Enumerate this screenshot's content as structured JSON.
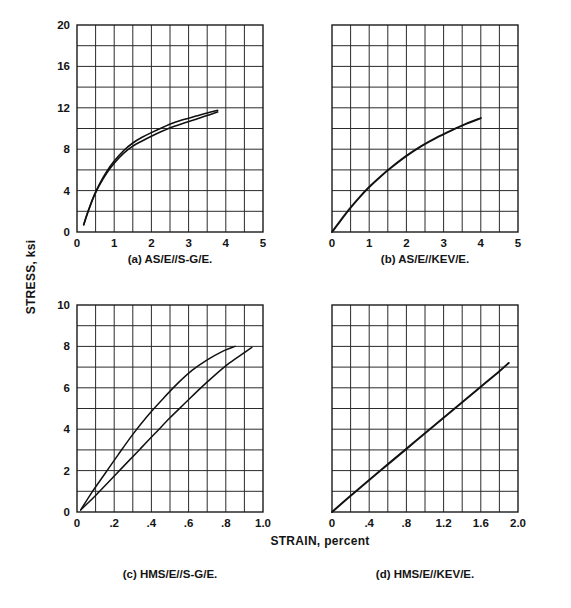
{
  "figure": {
    "axis_titles": {
      "y": "STRESS, ksi",
      "x": "STRAIN, percent"
    },
    "ink_color": "#111111",
    "grid_color": "#2b2b2b",
    "background": "#ffffff"
  },
  "chart_data": [
    {
      "id": "panel-a",
      "type": "line",
      "title": "(a) AS/E//S-G/E.",
      "caption": "(a) AS/E//S-G/E.",
      "xlabel": "STRAIN, percent",
      "ylabel": "STRESS, ksi",
      "xlim": [
        0,
        5
      ],
      "ylim": [
        0,
        20
      ],
      "x_ticks": [
        0,
        1,
        2,
        3,
        4,
        5
      ],
      "x_tick_labels": [
        "0",
        "1",
        "2",
        "3",
        "4",
        "5"
      ],
      "y_ticks": [
        0,
        4,
        8,
        12,
        16,
        20
      ],
      "y_tick_labels": [
        "0",
        "4",
        "8",
        "12",
        "16",
        "20"
      ],
      "grid": true,
      "grid_cols": 10,
      "grid_rows": 10,
      "legend": "none",
      "series": [
        {
          "name": "AS/E//S-G/E stress-strain band (upper)",
          "stroke_width": 1.6,
          "x": [
            0.18,
            0.3,
            0.45,
            0.6,
            0.8,
            1.0,
            1.25,
            1.5,
            1.75,
            2.0,
            2.3,
            2.6,
            2.9,
            3.2,
            3.5,
            3.78
          ],
          "y": [
            0.7,
            2.0,
            3.45,
            4.6,
            5.85,
            6.85,
            7.85,
            8.6,
            9.15,
            9.6,
            10.1,
            10.55,
            10.9,
            11.2,
            11.5,
            11.75
          ]
        },
        {
          "name": "AS/E//S-G/E stress-strain band (lower)",
          "stroke_width": 1.6,
          "x": [
            0.18,
            0.3,
            0.45,
            0.6,
            0.8,
            1.0,
            1.25,
            1.5,
            1.75,
            2.0,
            2.3,
            2.6,
            2.9,
            3.2,
            3.5,
            3.78
          ],
          "y": [
            0.7,
            2.0,
            3.4,
            4.5,
            5.7,
            6.65,
            7.6,
            8.3,
            8.8,
            9.25,
            9.75,
            10.2,
            10.55,
            10.9,
            11.25,
            11.6
          ]
        }
      ]
    },
    {
      "id": "panel-b",
      "type": "line",
      "title": "(b) AS/E//KEV/E.",
      "caption": "(b) AS/E//KEV/E.",
      "xlabel": "STRAIN, percent",
      "ylabel": "STRESS, ksi",
      "xlim": [
        0,
        5
      ],
      "ylim": [
        0,
        20
      ],
      "x_ticks": [
        0,
        1,
        2,
        3,
        4,
        5
      ],
      "x_tick_labels": [
        "0",
        "1",
        "2",
        "3",
        "4",
        "5"
      ],
      "y_ticks": [
        0,
        4,
        8,
        12,
        16,
        20
      ],
      "y_tick_labels": [],
      "grid": true,
      "grid_cols": 10,
      "grid_rows": 10,
      "legend": "none",
      "series": [
        {
          "name": "AS/E//KEV/E stress-strain",
          "stroke_width": 2.0,
          "x": [
            0.0,
            0.25,
            0.5,
            0.75,
            1.0,
            1.3,
            1.6,
            2.0,
            2.4,
            2.8,
            3.2,
            3.6,
            4.0
          ],
          "y": [
            0.0,
            1.2,
            2.35,
            3.4,
            4.35,
            5.35,
            6.25,
            7.35,
            8.3,
            9.1,
            9.8,
            10.45,
            11.0
          ]
        }
      ]
    },
    {
      "id": "panel-c",
      "type": "line",
      "title": "(c) HMS/E//S-G/E.",
      "caption": "(c) HMS/E//S-G/E.",
      "xlabel": "STRAIN, percent",
      "ylabel": "STRESS, ksi",
      "xlim": [
        0,
        1.0
      ],
      "ylim": [
        0,
        10
      ],
      "x_ticks": [
        0,
        0.2,
        0.4,
        0.6,
        0.8,
        1.0
      ],
      "x_tick_labels": [
        "0",
        ".2",
        ".4",
        ".6",
        ".8",
        "1.0"
      ],
      "y_ticks": [
        0,
        2,
        4,
        6,
        8,
        10
      ],
      "y_tick_labels": [
        "0",
        "2",
        "4",
        "6",
        "8",
        "10"
      ],
      "grid": true,
      "grid_cols": 10,
      "grid_rows": 10,
      "legend": "none",
      "series": [
        {
          "name": "HMS/E//S-G/E stress-strain (upper)",
          "stroke_width": 1.5,
          "x": [
            0.02,
            0.08,
            0.15,
            0.22,
            0.3,
            0.38,
            0.46,
            0.54,
            0.62,
            0.7,
            0.78,
            0.85
          ],
          "y": [
            0.1,
            0.95,
            1.85,
            2.75,
            3.75,
            4.65,
            5.45,
            6.2,
            6.85,
            7.35,
            7.75,
            8.0
          ]
        },
        {
          "name": "HMS/E//S-G/E stress-strain (lower)",
          "stroke_width": 1.5,
          "x": [
            0.02,
            0.1,
            0.18,
            0.26,
            0.34,
            0.42,
            0.5,
            0.58,
            0.66,
            0.74,
            0.82,
            0.9,
            0.94
          ],
          "y": [
            0.1,
            0.8,
            1.55,
            2.3,
            3.05,
            3.8,
            4.55,
            5.25,
            5.95,
            6.6,
            7.2,
            7.7,
            7.95
          ]
        }
      ]
    },
    {
      "id": "panel-d",
      "type": "line",
      "title": "(d) HMS/E//KEV/E.",
      "caption": "(d) HMS/E//KEV/E.",
      "xlabel": "STRAIN, percent",
      "ylabel": "STRESS, ksi",
      "xlim": [
        0,
        2.0
      ],
      "ylim": [
        0,
        10
      ],
      "x_ticks": [
        0,
        0.4,
        0.8,
        1.2,
        1.6,
        2.0
      ],
      "x_tick_labels": [
        "0",
        ".4",
        ".8",
        "1.2",
        "1.6",
        "2.0"
      ],
      "y_ticks": [
        0,
        2,
        4,
        6,
        8,
        10
      ],
      "y_tick_labels": [],
      "grid": true,
      "grid_cols": 10,
      "grid_rows": 10,
      "legend": "none",
      "series": [
        {
          "name": "HMS/E//KEV/E stress-strain",
          "stroke_width": 2.0,
          "x": [
            0.0,
            0.2,
            0.4,
            0.6,
            0.8,
            1.0,
            1.2,
            1.4,
            1.6,
            1.8,
            1.9
          ],
          "y": [
            0.0,
            0.78,
            1.55,
            2.3,
            3.05,
            3.8,
            4.55,
            5.3,
            6.05,
            6.8,
            7.2
          ]
        }
      ]
    }
  ]
}
